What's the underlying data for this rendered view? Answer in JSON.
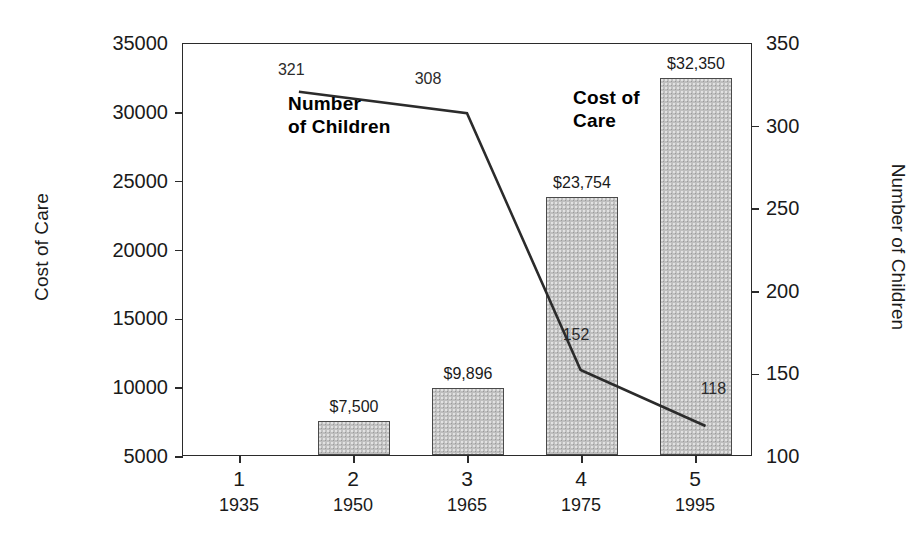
{
  "chart_data": {
    "type": "bar",
    "title": "",
    "categories": [
      "1",
      "2",
      "3",
      "4",
      "5"
    ],
    "category_sublabels": [
      "1935",
      "1950",
      "1965",
      "1975",
      "1995"
    ],
    "grid": false,
    "legend_position": "inline-annotations",
    "series": [
      {
        "name": "Cost of Care",
        "type": "bar",
        "axis": "left",
        "values": [
          null,
          7500,
          9896,
          23754,
          32350
        ],
        "value_labels": [
          "",
          "$7,500",
          "$9,896",
          "$23,754",
          "$32,350"
        ],
        "color": "#bfbfbf"
      },
      {
        "name": "Number of Children",
        "type": "line",
        "axis": "right",
        "values": [
          321,
          308,
          308,
          152,
          118
        ],
        "value_labels": [
          "321",
          "308",
          "",
          "152",
          "118"
        ],
        "color": "#2b2b2b"
      }
    ],
    "left_axis": {
      "label": "Cost of Care",
      "ticks": [
        "5000",
        "10000",
        "15000",
        "20000",
        "25000",
        "30000",
        "35000"
      ],
      "min": 5000,
      "max": 35000
    },
    "right_axis": {
      "label": "Number of Children",
      "ticks": [
        "100",
        "150",
        "200",
        "250",
        "300",
        "350"
      ],
      "min": 100,
      "max": 350
    },
    "annotations": [
      {
        "name": "number-of-children",
        "line1": "Number",
        "line2": "of Children"
      },
      {
        "name": "cost-of-care",
        "line1": "Cost of",
        "line2": "Care"
      }
    ]
  }
}
